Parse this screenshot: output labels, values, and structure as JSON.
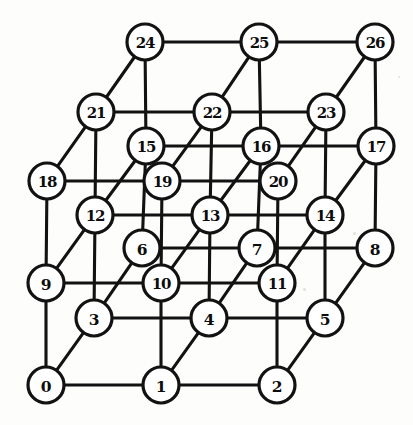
{
  "figure": {
    "name": "3x3x3 grid graph",
    "width": 413,
    "height": 425,
    "background_color": "#fdfdfc",
    "line_color": "#121212",
    "node_fill": "#ffffff",
    "node_radius": 18,
    "edge_width": 3.1
  },
  "projection": {
    "origin_x": 46,
    "origin_y": 385,
    "x_step": [
      115,
      0
    ],
    "y_step": [
      48,
      -67
    ],
    "z_step": [
      0,
      -102
    ]
  },
  "chart_data": {
    "type": "diagram",
    "title": "",
    "layout": "axonometric 3x3x3 lattice, node index = x + 3y + 9z",
    "nodes": [
      {
        "label": "0",
        "grid": [
          0,
          0,
          0
        ],
        "px": 46,
        "py": 385
      },
      {
        "label": "1",
        "grid": [
          1,
          0,
          0
        ],
        "px": 161,
        "py": 385
      },
      {
        "label": "2",
        "grid": [
          2,
          0,
          0
        ],
        "px": 277,
        "py": 385
      },
      {
        "label": "3",
        "grid": [
          0,
          1,
          0
        ],
        "px": 94,
        "py": 318
      },
      {
        "label": "4",
        "grid": [
          1,
          1,
          0
        ],
        "px": 209,
        "py": 318
      },
      {
        "label": "5",
        "grid": [
          2,
          1,
          0
        ],
        "px": 325,
        "py": 318
      },
      {
        "label": "6",
        "grid": [
          0,
          2,
          0
        ],
        "px": 142,
        "py": 248
      },
      {
        "label": "7",
        "grid": [
          1,
          2,
          0
        ],
        "px": 257,
        "py": 248
      },
      {
        "label": "8",
        "grid": [
          2,
          2,
          0
        ],
        "px": 375,
        "py": 248
      },
      {
        "label": "9",
        "grid": [
          0,
          0,
          1
        ],
        "px": 46,
        "py": 283
      },
      {
        "label": "10",
        "grid": [
          1,
          0,
          1
        ],
        "px": 161,
        "py": 283
      },
      {
        "label": "11",
        "grid": [
          2,
          0,
          1
        ],
        "px": 277,
        "py": 283
      },
      {
        "label": "12",
        "grid": [
          0,
          1,
          1
        ],
        "px": 95,
        "py": 215
      },
      {
        "label": "13",
        "grid": [
          1,
          1,
          1
        ],
        "px": 210,
        "py": 215
      },
      {
        "label": "14",
        "grid": [
          2,
          1,
          1
        ],
        "px": 325,
        "py": 215
      },
      {
        "label": "15",
        "grid": [
          0,
          2,
          1
        ],
        "px": 146,
        "py": 146
      },
      {
        "label": "16",
        "grid": [
          1,
          2,
          1
        ],
        "px": 261,
        "py": 146
      },
      {
        "label": "17",
        "grid": [
          2,
          2,
          1
        ],
        "px": 376,
        "py": 146
      },
      {
        "label": "18",
        "grid": [
          0,
          0,
          2
        ],
        "px": 47,
        "py": 181
      },
      {
        "label": "19",
        "grid": [
          1,
          0,
          2
        ],
        "px": 162,
        "py": 181
      },
      {
        "label": "20",
        "grid": [
          2,
          0,
          2
        ],
        "px": 278,
        "py": 181
      },
      {
        "label": "21",
        "grid": [
          0,
          1,
          2
        ],
        "px": 96,
        "py": 112
      },
      {
        "label": "22",
        "grid": [
          1,
          1,
          2
        ],
        "px": 212,
        "py": 112
      },
      {
        "label": "23",
        "grid": [
          2,
          1,
          2
        ],
        "px": 326,
        "py": 112
      },
      {
        "label": "24",
        "grid": [
          0,
          2,
          2
        ],
        "px": 145,
        "py": 42
      },
      {
        "label": "25",
        "grid": [
          1,
          2,
          2
        ],
        "px": 259,
        "py": 42
      },
      {
        "label": "26",
        "grid": [
          2,
          2,
          2
        ],
        "px": 375,
        "py": 42
      }
    ],
    "edges": [
      [
        0,
        1
      ],
      [
        1,
        2
      ],
      [
        3,
        4
      ],
      [
        4,
        5
      ],
      [
        6,
        7
      ],
      [
        7,
        8
      ],
      [
        9,
        10
      ],
      [
        10,
        11
      ],
      [
        12,
        13
      ],
      [
        13,
        14
      ],
      [
        15,
        16
      ],
      [
        16,
        17
      ],
      [
        18,
        19
      ],
      [
        19,
        20
      ],
      [
        21,
        22
      ],
      [
        22,
        23
      ],
      [
        24,
        25
      ],
      [
        25,
        26
      ],
      [
        0,
        3
      ],
      [
        3,
        6
      ],
      [
        1,
        4
      ],
      [
        4,
        7
      ],
      [
        2,
        5
      ],
      [
        5,
        8
      ],
      [
        9,
        12
      ],
      [
        12,
        15
      ],
      [
        10,
        13
      ],
      [
        13,
        16
      ],
      [
        11,
        14
      ],
      [
        14,
        17
      ],
      [
        18,
        21
      ],
      [
        21,
        24
      ],
      [
        19,
        22
      ],
      [
        22,
        25
      ],
      [
        20,
        23
      ],
      [
        23,
        26
      ],
      [
        0,
        9
      ],
      [
        9,
        18
      ],
      [
        1,
        10
      ],
      [
        10,
        19
      ],
      [
        2,
        11
      ],
      [
        11,
        20
      ],
      [
        3,
        12
      ],
      [
        12,
        21
      ],
      [
        4,
        13
      ],
      [
        13,
        22
      ],
      [
        5,
        14
      ],
      [
        14,
        23
      ],
      [
        6,
        15
      ],
      [
        15,
        24
      ],
      [
        7,
        16
      ],
      [
        16,
        25
      ],
      [
        8,
        17
      ],
      [
        17,
        26
      ]
    ],
    "node_count": 27,
    "edge_count": 54
  }
}
